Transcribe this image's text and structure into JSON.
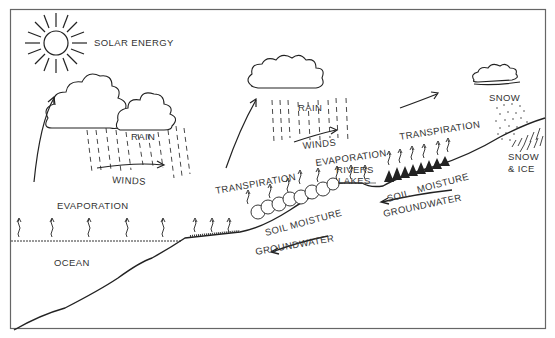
{
  "diagram": {
    "labels": {
      "solar_energy": "SOLAR ENERGY",
      "rain_left": "RAIN",
      "winds_left": "WINDS",
      "rain_mid": "RAIN",
      "winds_mid": "WINDS",
      "snow": "SNOW",
      "snow_ice_1": "SNOW",
      "snow_ice_2": "& ICE",
      "evaporation_ocean": "EVAPORATION",
      "ocean": "OCEAN",
      "transpiration_left": "TRANSPIRATION",
      "evaporation_mid": "EVAPORATION",
      "transpiration_right": "TRANSPIRATION",
      "rivers": "RIVERS",
      "lakes": "LAKES",
      "soil_moisture_left": "SOIL MOISTURE",
      "groundwater_left": "GROUNDWATER",
      "soil": "SOIL",
      "moisture": "MOISTURE",
      "groundwater_right": "GROUNDWATER"
    },
    "colors": {
      "line": "#222222",
      "text": "#333333",
      "background": "#ffffff",
      "frame": "#555555"
    }
  }
}
